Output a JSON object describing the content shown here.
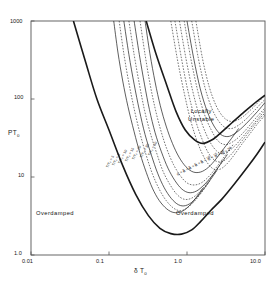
{
  "chart_data": {
    "type": "line",
    "title": "",
    "xlabel": "δ T",
    "xlabel_sub": "0",
    "ylabel": "PT",
    "ylabel_sub": "0",
    "xscale": "log",
    "yscale": "log",
    "xlim": [
      0.01,
      10.0
    ],
    "ylim": [
      1.0,
      1000
    ],
    "grid": false,
    "legend": "none",
    "xticks": [
      "0.01",
      "0.1",
      "1.0",
      "10.0"
    ],
    "xtick_values": [
      0.01,
      0.1,
      1.0,
      10.0
    ],
    "yticks": [
      "1.0",
      "10",
      "100",
      "1000"
    ],
    "ytick_values": [
      1.0,
      10,
      100,
      1000
    ],
    "annotations": [
      {
        "text": "Locally\nUnstable",
        "line1": "Locally",
        "line2": "Unstable",
        "x": 2.2,
        "y": 120
      },
      {
        "text": "Overdamped",
        "x": 0.05,
        "y": 2.6
      },
      {
        "text": "Overdamped",
        "x": 2.6,
        "y": 2.6
      }
    ],
    "curve_labels_left": [
      "T/T₀ = 5",
      "T/T₀ = 8",
      "T/T₀ = 10",
      "T/T₀ = 15",
      "T/T₀ = 20",
      "T/T₀ = 30",
      "T/T₀ = 50"
    ],
    "curve_labels_right": [
      "R = 2",
      "R = 3",
      "R = 5",
      "R = 8",
      "R = 10",
      "R = 15",
      "R = 20",
      "R = 30"
    ],
    "series": [
      {
        "name": "envelope-outer",
        "style": "solid",
        "width": 1.6,
        "points": [
          [
            0.035,
            1000
          ],
          [
            0.05,
            300
          ],
          [
            0.07,
            100
          ],
          [
            0.1,
            40
          ],
          [
            0.15,
            14
          ],
          [
            0.22,
            6.0
          ],
          [
            0.32,
            3.2
          ],
          [
            0.45,
            2.2
          ],
          [
            0.62,
            1.88
          ],
          [
            0.85,
            1.85
          ],
          [
            1.15,
            2.1
          ],
          [
            1.5,
            2.7
          ],
          [
            2.0,
            3.7
          ],
          [
            2.8,
            5.2
          ],
          [
            4.0,
            8.0
          ],
          [
            6.0,
            13.5
          ],
          [
            8.0,
            20
          ],
          [
            10.0,
            28
          ]
        ]
      },
      {
        "name": "envelope-upper-right",
        "style": "solid",
        "width": 1.6,
        "points": [
          [
            0.3,
            1000
          ],
          [
            0.4,
            380
          ],
          [
            0.55,
            150
          ],
          [
            0.72,
            70
          ],
          [
            0.95,
            40
          ],
          [
            1.25,
            30
          ],
          [
            1.6,
            27
          ],
          [
            2.1,
            30
          ],
          [
            2.8,
            38
          ],
          [
            3.8,
            50
          ],
          [
            5.2,
            66
          ],
          [
            7.0,
            85
          ],
          [
            10.0,
            112
          ]
        ]
      },
      {
        "name": "curve-T5",
        "style": "solid",
        "width": 0.7,
        "points": [
          [
            0.115,
            1000
          ],
          [
            0.13,
            400
          ],
          [
            0.15,
            170
          ],
          [
            0.175,
            80
          ],
          [
            0.21,
            38
          ],
          [
            0.25,
            20
          ],
          [
            0.3,
            11.5
          ],
          [
            0.36,
            7.2
          ],
          [
            0.44,
            5.0
          ],
          [
            0.55,
            3.9
          ],
          [
            0.68,
            3.5
          ],
          [
            0.85,
            3.6
          ],
          [
            1.05,
            4.2
          ],
          [
            1.3,
            5.4
          ],
          [
            1.6,
            7.2
          ]
        ]
      },
      {
        "name": "curve-T8",
        "style": "dashed",
        "width": 0.6,
        "points": [
          [
            0.135,
            1000
          ],
          [
            0.155,
            380
          ],
          [
            0.18,
            160
          ],
          [
            0.21,
            75
          ],
          [
            0.25,
            36
          ],
          [
            0.3,
            19
          ],
          [
            0.36,
            11
          ],
          [
            0.44,
            7.0
          ],
          [
            0.54,
            5.0
          ],
          [
            0.67,
            4.0
          ],
          [
            0.82,
            3.7
          ],
          [
            1.0,
            4.0
          ],
          [
            1.25,
            4.9
          ],
          [
            1.55,
            6.4
          ],
          [
            1.95,
            8.8
          ]
        ]
      },
      {
        "name": "curve-T10",
        "style": "solid",
        "width": 0.7,
        "points": [
          [
            0.155,
            1000
          ],
          [
            0.18,
            370
          ],
          [
            0.21,
            155
          ],
          [
            0.245,
            72
          ],
          [
            0.29,
            35
          ],
          [
            0.35,
            19
          ],
          [
            0.42,
            11.2
          ],
          [
            0.51,
            7.3
          ],
          [
            0.63,
            5.3
          ],
          [
            0.78,
            4.4
          ],
          [
            0.96,
            4.3
          ],
          [
            1.2,
            4.9
          ],
          [
            1.5,
            6.3
          ],
          [
            1.9,
            8.6
          ],
          [
            2.4,
            12
          ]
        ]
      },
      {
        "name": "curve-T15",
        "style": "dashed",
        "width": 0.6,
        "points": [
          [
            0.18,
            1000
          ],
          [
            0.21,
            370
          ],
          [
            0.245,
            155
          ],
          [
            0.285,
            72
          ],
          [
            0.34,
            36
          ],
          [
            0.41,
            20
          ],
          [
            0.49,
            12
          ],
          [
            0.6,
            8.1
          ],
          [
            0.74,
            6.0
          ],
          [
            0.91,
            5.2
          ],
          [
            1.12,
            5.3
          ],
          [
            1.4,
            6.2
          ],
          [
            1.75,
            8.0
          ],
          [
            2.2,
            11
          ],
          [
            2.8,
            15.5
          ]
        ]
      },
      {
        "name": "curve-T20",
        "style": "solid",
        "width": 0.7,
        "points": [
          [
            0.21,
            1000
          ],
          [
            0.245,
            370
          ],
          [
            0.285,
            155
          ],
          [
            0.33,
            73
          ],
          [
            0.39,
            37
          ],
          [
            0.47,
            21
          ],
          [
            0.57,
            13
          ],
          [
            0.7,
            9.0
          ],
          [
            0.86,
            7.0
          ],
          [
            1.06,
            6.3
          ],
          [
            1.32,
            6.6
          ],
          [
            1.65,
            7.9
          ],
          [
            2.1,
            10.4
          ],
          [
            2.65,
            14.3
          ],
          [
            3.3,
            19.5
          ]
        ]
      },
      {
        "name": "curve-T30",
        "style": "dashed",
        "width": 0.6,
        "points": [
          [
            0.25,
            1000
          ],
          [
            0.29,
            370
          ],
          [
            0.335,
            158
          ],
          [
            0.39,
            76
          ],
          [
            0.46,
            40
          ],
          [
            0.55,
            23
          ],
          [
            0.67,
            14.5
          ],
          [
            0.82,
            10.4
          ],
          [
            1.0,
            8.4
          ],
          [
            1.24,
            7.9
          ],
          [
            1.55,
            8.5
          ],
          [
            1.95,
            10.4
          ],
          [
            2.45,
            13.8
          ],
          [
            3.1,
            19
          ],
          [
            3.9,
            26
          ]
        ]
      },
      {
        "name": "curve-T50",
        "style": "solid",
        "width": 0.7,
        "points": [
          [
            0.29,
            1000
          ],
          [
            0.335,
            380
          ],
          [
            0.39,
            165
          ],
          [
            0.455,
            82
          ],
          [
            0.54,
            45
          ],
          [
            0.65,
            27
          ],
          [
            0.79,
            18
          ],
          [
            0.97,
            13.5
          ],
          [
            1.2,
            11.6
          ],
          [
            1.5,
            11.6
          ],
          [
            1.88,
            13.3
          ],
          [
            2.35,
            17
          ],
          [
            2.95,
            23
          ],
          [
            3.7,
            31
          ],
          [
            4.6,
            42
          ]
        ]
      },
      {
        "name": "curve-R2",
        "style": "dashed",
        "width": 0.6,
        "points": [
          [
            0.62,
            1000
          ],
          [
            0.75,
            330
          ],
          [
            0.92,
            120
          ],
          [
            1.12,
            52
          ],
          [
            1.38,
            27
          ],
          [
            1.7,
            17
          ],
          [
            2.1,
            13
          ],
          [
            2.6,
            12.5
          ],
          [
            3.2,
            14.5
          ],
          [
            4.0,
            19
          ],
          [
            5.0,
            26
          ],
          [
            6.3,
            35
          ],
          [
            8.0,
            48
          ],
          [
            10.0,
            62
          ]
        ]
      },
      {
        "name": "curve-R3",
        "style": "dashed",
        "width": 0.6,
        "points": [
          [
            0.7,
            1000
          ],
          [
            0.85,
            330
          ],
          [
            1.03,
            125
          ],
          [
            1.26,
            57
          ],
          [
            1.55,
            31
          ],
          [
            1.9,
            20
          ],
          [
            2.35,
            16
          ],
          [
            2.9,
            16
          ],
          [
            3.6,
            19
          ],
          [
            4.5,
            25
          ],
          [
            5.6,
            33
          ],
          [
            7.0,
            44
          ],
          [
            8.8,
            58
          ],
          [
            10.0,
            66
          ]
        ]
      },
      {
        "name": "curve-R5",
        "style": "dashed",
        "width": 0.6,
        "points": [
          [
            0.8,
            1000
          ],
          [
            0.97,
            330
          ],
          [
            1.18,
            128
          ],
          [
            1.44,
            61
          ],
          [
            1.77,
            35
          ],
          [
            2.18,
            24
          ],
          [
            2.7,
            20
          ],
          [
            3.3,
            21
          ],
          [
            4.1,
            25
          ],
          [
            5.1,
            32
          ],
          [
            6.4,
            42
          ],
          [
            8.0,
            55
          ],
          [
            10.0,
            72
          ]
        ]
      },
      {
        "name": "curve-R8",
        "style": "dashed",
        "width": 0.6,
        "points": [
          [
            0.92,
            1000
          ],
          [
            1.12,
            330
          ],
          [
            1.36,
            132
          ],
          [
            1.66,
            65
          ],
          [
            2.05,
            40
          ],
          [
            2.5,
            29
          ],
          [
            3.1,
            26
          ],
          [
            3.8,
            28
          ],
          [
            4.7,
            33
          ],
          [
            5.9,
            42
          ],
          [
            7.4,
            55
          ],
          [
            9.3,
            71
          ],
          [
            10.0,
            77
          ]
        ]
      },
      {
        "name": "curve-R10",
        "style": "solid",
        "width": 0.7,
        "points": [
          [
            1.0,
            1000
          ],
          [
            1.22,
            330
          ],
          [
            1.48,
            135
          ],
          [
            1.81,
            70
          ],
          [
            2.22,
            45
          ],
          [
            2.72,
            35
          ],
          [
            3.35,
            33
          ],
          [
            4.1,
            36
          ],
          [
            5.1,
            43
          ],
          [
            6.4,
            54
          ],
          [
            8.0,
            69
          ],
          [
            10.0,
            90
          ]
        ]
      },
      {
        "name": "curve-R15",
        "style": "dashed",
        "width": 0.6,
        "points": [
          [
            1.15,
            1000
          ],
          [
            1.4,
            330
          ],
          [
            1.7,
            140
          ],
          [
            2.08,
            76
          ],
          [
            2.55,
            52
          ],
          [
            3.1,
            43
          ],
          [
            3.8,
            42
          ],
          [
            4.7,
            47
          ],
          [
            5.9,
            57
          ],
          [
            7.4,
            72
          ],
          [
            9.3,
            92
          ],
          [
            10.0,
            98
          ]
        ]
      },
      {
        "name": "curve-R20",
        "style": "dashed",
        "width": 0.6,
        "points": [
          [
            1.3,
            1000
          ],
          [
            1.58,
            330
          ],
          [
            1.92,
            145
          ],
          [
            2.35,
            83
          ],
          [
            2.87,
            60
          ],
          [
            3.5,
            52
          ],
          [
            4.3,
            53
          ],
          [
            5.3,
            60
          ],
          [
            6.6,
            73
          ],
          [
            8.3,
            92
          ],
          [
            10.0,
            112
          ]
        ]
      }
    ]
  },
  "figure": {
    "frame_color": "#555555",
    "curve_color": "#1a1a1a",
    "background": "#ffffff"
  }
}
